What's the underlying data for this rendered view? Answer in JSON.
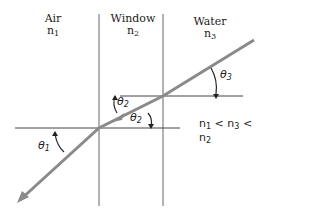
{
  "media": [
    {
      "name": "Air",
      "index_symbol": "n",
      "index_sub": "1"
    },
    {
      "name": "Window",
      "index_symbol": "n",
      "index_sub": "2"
    },
    {
      "name": "Water",
      "index_symbol": "n",
      "index_sub": "3"
    }
  ],
  "angles": {
    "theta1": {
      "symbol": "θ",
      "sub": "1"
    },
    "theta2a": {
      "symbol": "θ",
      "sub": "2"
    },
    "theta2b": {
      "symbol": "θ",
      "sub": "2"
    },
    "theta3": {
      "symbol": "θ",
      "sub": "3"
    }
  },
  "relation": {
    "n1": "n",
    "n1_sub": "1",
    "lt1": "<",
    "n3": "n",
    "n3_sub": "3",
    "lt2": "<",
    "n2": "n",
    "n2_sub": "2"
  },
  "colors": {
    "ray": "#8a8a8a",
    "line": "#555555",
    "text": "#222222"
  }
}
